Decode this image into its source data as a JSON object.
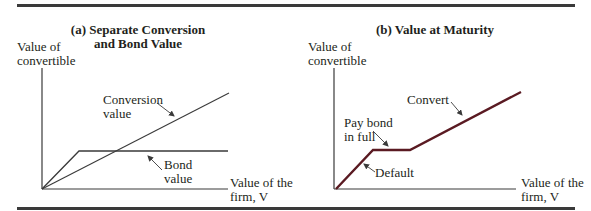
{
  "panel_a": {
    "title_line1": "(a) Separate Conversion",
    "title_line2": "and Bond Value",
    "y_axis_label_line1": "Value of",
    "y_axis_label_line2": "convertible",
    "x_axis_label_line1": "Value of the",
    "x_axis_label_line2": "firm, V",
    "conversion_label_line1": "Conversion",
    "conversion_label_line2": "value",
    "bond_label_line1": "Bond",
    "bond_label_line2": "value"
  },
  "panel_b": {
    "title": "(b) Value at Maturity",
    "y_axis_label_line1": "Value of",
    "y_axis_label_line2": "convertible",
    "x_axis_label_line1": "Value of the",
    "x_axis_label_line2": "firm, V",
    "convert_label": "Convert",
    "pay_bond_label_line1": "Pay bond",
    "pay_bond_label_line2": "in full",
    "default_label": "Default"
  },
  "colors": {
    "panel_a_lines": "#3a3a3a",
    "panel_b_payoff": "#5a1a22",
    "axes": "#3a3a3a"
  }
}
